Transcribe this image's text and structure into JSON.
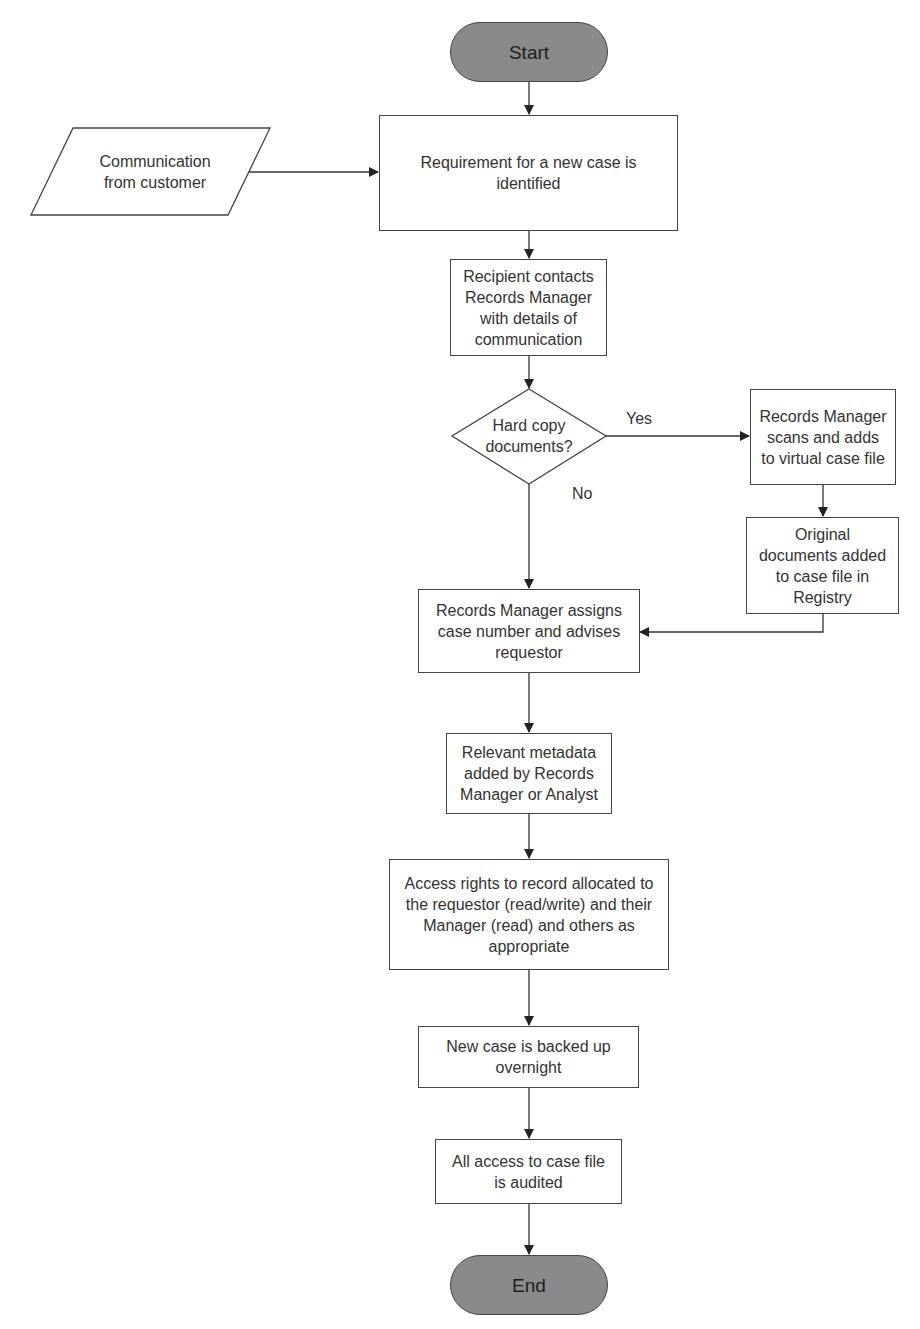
{
  "diagram": {
    "type": "flowchart",
    "colors": {
      "terminal_fill": "#8a8a8a",
      "stroke": "#444444",
      "box_fill": "#ffffff"
    },
    "nodes": {
      "start": "Start",
      "input": "Communication\nfrom customer",
      "requirement": "Requirement for a new case is\nidentified",
      "contact": "Recipient contacts\nRecords Manager\nwith details of\ncommunication",
      "decision": "Hard copy\ndocuments?",
      "scan": "Records Manager\nscans and adds\nto virtual case file",
      "original": "Original\ndocuments added\nto case file in\nRegistry",
      "assign": "Records Manager assigns\ncase number and advises\nrequestor",
      "metadata": "Relevant metadata\nadded by Records\nManager or Analyst",
      "access": "Access rights to record allocated to\nthe requestor (read/write) and their\nManager (read) and others as\nappropriate",
      "backup": "New case is backed up\novernight",
      "audit": "All access to case file\nis audited",
      "end": "End"
    },
    "edge_labels": {
      "yes": "Yes",
      "no": "No"
    }
  }
}
